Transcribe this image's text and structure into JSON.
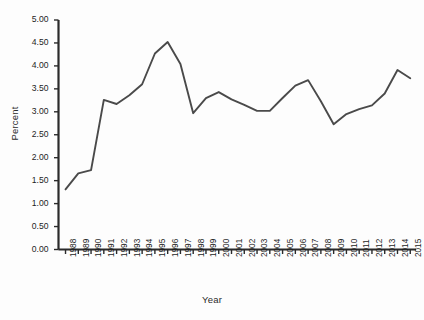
{
  "chart_data": {
    "type": "line",
    "title": "",
    "xlabel": "Year",
    "ylabel": "Percent",
    "grid": false,
    "legend": false,
    "ylim": [
      0.0,
      5.0
    ],
    "ytick_step": 0.5,
    "yticks": [
      "0.00",
      "0.50",
      "1.00",
      "1.50",
      "2.00",
      "2.50",
      "3.00",
      "3.50",
      "4.00",
      "4.50",
      "5.00"
    ],
    "categories": [
      "1988",
      "1989",
      "1990",
      "1991",
      "1992",
      "1993",
      "1994",
      "1995",
      "1996",
      "1997",
      "1998",
      "1999",
      "2000",
      "2001",
      "2002",
      "2003",
      "2004",
      "2005",
      "2006",
      "2007",
      "2008",
      "2009",
      "2010",
      "2011",
      "2012",
      "2013",
      "2014",
      "2015"
    ],
    "series": [
      {
        "name": "Percent",
        "color": "#4a4a4a",
        "values": [
          1.31,
          1.66,
          1.73,
          3.26,
          3.17,
          3.36,
          3.6,
          4.27,
          4.52,
          4.04,
          2.97,
          3.3,
          3.43,
          3.27,
          3.15,
          3.02,
          3.02,
          3.3,
          3.57,
          3.69,
          3.23,
          2.73,
          2.95,
          3.06,
          3.14,
          3.4,
          3.91,
          3.73
        ]
      }
    ]
  }
}
